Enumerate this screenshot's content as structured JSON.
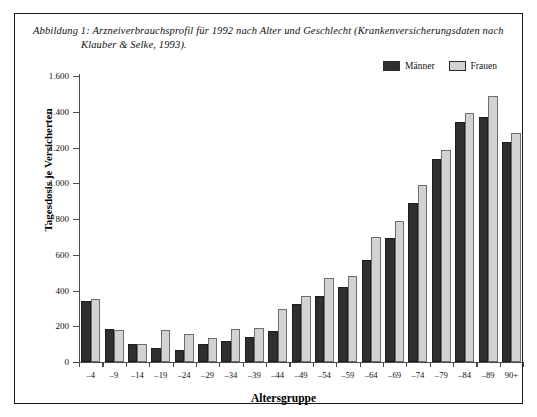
{
  "caption": {
    "line1": "Abbildung 1: Arzneiverbrauchsprofil für 1992 nach Alter und Geschlecht (Krankenversicherungsdaten nach",
    "line2": "Klauber & Selke, 1993)."
  },
  "legend": {
    "items": [
      {
        "label": "Männer",
        "color": "#2f2f2f",
        "swatch_name": "legend-swatch-maenner"
      },
      {
        "label": "Frauen",
        "color": "#d2d2d2",
        "swatch_name": "legend-swatch-frauen"
      }
    ]
  },
  "chart_data": {
    "type": "bar",
    "title": "Arzneiverbrauchsprofil für 1992 nach Alter und Geschlecht",
    "xlabel": "Altersgruppe",
    "ylabel": "Tagesdosis je Versicherten",
    "ylim": [
      0,
      1600
    ],
    "yticks": [
      0,
      200,
      400,
      600,
      800,
      1000,
      1200,
      1400,
      1600
    ],
    "ytick_labels": [
      "0",
      "200",
      "400",
      "600",
      "800",
      "1.000",
      "1.200",
      "1.400",
      "1.600"
    ],
    "grid": false,
    "legend_position": "top-right",
    "categories": [
      "–4",
      "–9",
      "–14",
      "–19",
      "–24",
      "–29",
      "–34",
      "–39",
      "–44",
      "–49",
      "–54",
      "–59",
      "–64",
      "–69",
      "–74",
      "–79",
      "–84",
      "–89",
      "90+"
    ],
    "series": [
      {
        "name": "Männer",
        "color": "#2f2f2f",
        "values": [
          340,
          183,
          98,
          78,
          70,
          100,
          118,
          140,
          175,
          325,
          372,
          420,
          572,
          692,
          890,
          1135,
          1345,
          1370,
          1232
        ]
      },
      {
        "name": "Frauen",
        "color": "#d2d2d2",
        "values": [
          352,
          180,
          103,
          178,
          155,
          135,
          182,
          193,
          297,
          368,
          470,
          483,
          697,
          790,
          988,
          1188,
          1392,
          1488,
          1282
        ]
      }
    ]
  }
}
